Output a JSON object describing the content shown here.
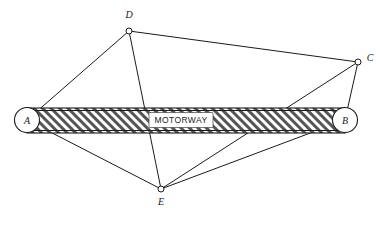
{
  "figure": {
    "background_color": "#ffffff",
    "line_color": "#1b1b1b",
    "hatch_color": "#4a4a4a",
    "width": 390,
    "height": 226
  },
  "motorway": {
    "label": "MOTORWAY",
    "hatch_pattern": "diagonal-forward-slash",
    "left_node": "A",
    "right_node": "B"
  },
  "nodes": [
    {
      "id": "A",
      "label": "A",
      "x": 27,
      "y": 120,
      "style": "circle",
      "radius": 12,
      "label_x": 27,
      "label_y": 124
    },
    {
      "id": "B",
      "label": "B",
      "x": 345,
      "y": 120,
      "style": "circle",
      "radius": 12,
      "label_x": 345,
      "label_y": 124
    },
    {
      "id": "C",
      "label": "C",
      "x": 358,
      "y": 62,
      "style": "dot",
      "radius": 3,
      "label_x": 370,
      "label_y": 61
    },
    {
      "id": "D",
      "label": "D",
      "x": 129,
      "y": 31,
      "style": "dot",
      "radius": 3,
      "label_x": 129,
      "label_y": 18
    },
    {
      "id": "E",
      "label": "E",
      "x": 161,
      "y": 189,
      "style": "dot",
      "radius": 3,
      "label_x": 161,
      "label_y": 205
    }
  ],
  "edges": [
    {
      "id": "A-D",
      "from": "A",
      "to": "D"
    },
    {
      "id": "D-C",
      "from": "D",
      "to": "C"
    },
    {
      "id": "C-B",
      "from": "C",
      "to": "B"
    },
    {
      "id": "A-E",
      "from": "A",
      "to": "E"
    },
    {
      "id": "E-B",
      "from": "E",
      "to": "B"
    },
    {
      "id": "D-E",
      "from": "D",
      "to": "E"
    },
    {
      "id": "C-E",
      "from": "C",
      "to": "E"
    }
  ]
}
